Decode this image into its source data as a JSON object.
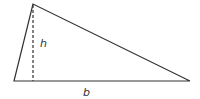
{
  "diagram": {
    "shape": "triangle",
    "vertices": {
      "apex": [
        33,
        4
      ],
      "base_left": [
        14,
        81
      ],
      "base_right": [
        190,
        81
      ]
    },
    "height_line": {
      "from": [
        33,
        4
      ],
      "to": [
        33,
        81
      ],
      "style": "dashed"
    },
    "labels": {
      "height": "h",
      "base": "b"
    },
    "colors": {
      "stroke": "#333333",
      "background": "#ffffff"
    }
  }
}
